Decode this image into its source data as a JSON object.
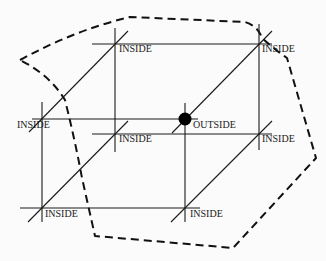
{
  "diagram": {
    "type": "lattice-inside-outside",
    "colors": {
      "ink": "#1a1a1a",
      "background": "#fbfbfb",
      "dot": "#000000"
    },
    "points": [
      {
        "id": "p1",
        "x": 115,
        "y": 44,
        "label": "INSIDE",
        "lx": 119,
        "ly": 52
      },
      {
        "id": "p2",
        "x": 259,
        "y": 44,
        "label": "INSIDE",
        "lx": 262,
        "ly": 52
      },
      {
        "id": "p3",
        "x": 42,
        "y": 119,
        "label": "INSIDE",
        "lx": 17,
        "ly": 128
      },
      {
        "id": "p4",
        "x": 185,
        "y": 119,
        "label": "OUTSIDE",
        "lx": 193,
        "ly": 128,
        "highlighted": true
      },
      {
        "id": "p5",
        "x": 115,
        "y": 134,
        "label": "INSIDE",
        "lx": 119,
        "ly": 142
      },
      {
        "id": "p6",
        "x": 259,
        "y": 134,
        "label": "INSIDE",
        "lx": 262,
        "ly": 142
      },
      {
        "id": "p7",
        "x": 42,
        "y": 208,
        "label": "INSIDE",
        "lx": 45,
        "ly": 217
      },
      {
        "id": "p8",
        "x": 185,
        "y": 208,
        "label": "INSIDE",
        "lx": 190,
        "ly": 217
      }
    ],
    "labels": {
      "p1": "INSIDE",
      "p2": "INSIDE",
      "p3": "INSIDE",
      "p4": "OUTSIDE",
      "p5": "INSIDE",
      "p6": "INSIDE",
      "p7": "INSIDE",
      "p8": "INSIDE"
    }
  }
}
